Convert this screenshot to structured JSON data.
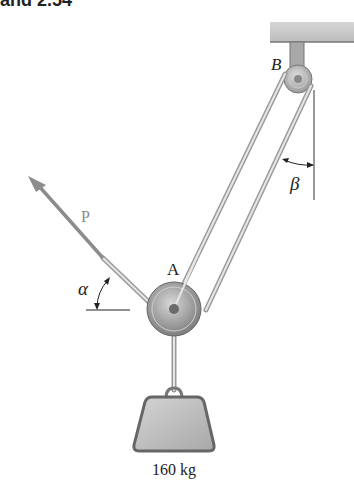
{
  "header": {
    "text": "and 2.54"
  },
  "diagram": {
    "labels": {
      "pulley_b": "B",
      "pulley_a": "A",
      "force": "P",
      "angle_alpha": "α",
      "angle_beta": "β",
      "mass": "160 kg"
    },
    "colors": {
      "ceiling": "#c9c9c9",
      "rope": "#bdbdbd",
      "pulley": "#9a9a9a",
      "force_arrow": "#8c8c8c",
      "weight": "#b5b5b5"
    }
  }
}
